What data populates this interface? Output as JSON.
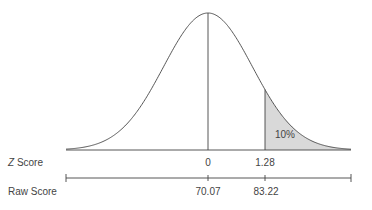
{
  "chart_data": {
    "type": "area",
    "title": "",
    "distribution": "normal",
    "mean_z": 0,
    "cutoff_z": 1.28,
    "shaded_region": {
      "from_z": 1.28,
      "to_z": "inf",
      "label": "10%"
    },
    "axes": [
      {
        "name": "Z Score",
        "ticks": [
          {
            "z": 0,
            "label": "0"
          },
          {
            "z": 1.28,
            "label": "1.28"
          }
        ]
      },
      {
        "name": "Raw Score",
        "ticks": [
          {
            "z": 0,
            "label": "70.07"
          },
          {
            "z": 1.28,
            "label": "83.22"
          }
        ]
      }
    ],
    "legend": null,
    "grid": false
  },
  "labels": {
    "z_axis_prefix": "Z",
    "z_axis_suffix": " Score",
    "raw_axis": "Raw Score",
    "shade_label": "10%",
    "z_tick_0": "0",
    "z_tick_1": "1.28",
    "raw_tick_0": "70.07",
    "raw_tick_1": "83.22"
  },
  "colors": {
    "line": "#444444",
    "shade": "#d9d9d9",
    "text": "#444444"
  }
}
